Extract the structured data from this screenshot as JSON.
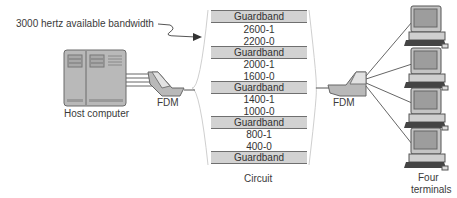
{
  "annotation": {
    "text": "3000 hertz available bandwidth"
  },
  "host": {
    "label": "Host computer"
  },
  "mux_left": {
    "label": "FDM"
  },
  "mux_right": {
    "label": "FDM"
  },
  "circuit": {
    "label": "Circuit",
    "bands": [
      {
        "type": "guard",
        "label": "Guardband"
      },
      {
        "type": "freq",
        "label": "2600-1"
      },
      {
        "type": "freq",
        "label": "2200-0"
      },
      {
        "type": "guard",
        "label": "Guardband"
      },
      {
        "type": "freq",
        "label": "2000-1"
      },
      {
        "type": "freq",
        "label": "1600-0"
      },
      {
        "type": "guard",
        "label": "Guardband"
      },
      {
        "type": "freq",
        "label": "1400-1"
      },
      {
        "type": "freq",
        "label": "1000-0"
      },
      {
        "type": "guard",
        "label": "Guardband"
      },
      {
        "type": "freq",
        "label": "800-1"
      },
      {
        "type": "freq",
        "label": "400-0"
      },
      {
        "type": "guard",
        "label": "Guardband"
      }
    ]
  },
  "terminals": {
    "label_line1": "Four",
    "label_line2": "terminals",
    "count": 4
  },
  "colors": {
    "device_fill": "#b8b8b8",
    "guardband_fill": "#d2d2d2",
    "line": "#6a6a6a"
  }
}
